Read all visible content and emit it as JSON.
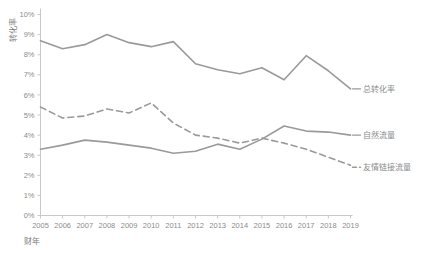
{
  "chart_data": {
    "type": "line",
    "title": "",
    "xlabel": "财年",
    "ylabel": "转化率",
    "x": [
      2005,
      2006,
      2007,
      2008,
      2009,
      2010,
      2011,
      2012,
      2013,
      2014,
      2015,
      2016,
      2017,
      2018,
      2019
    ],
    "xtick_labels": [
      "2005",
      "2006",
      "2007",
      "2008",
      "2009",
      "2010",
      "2011",
      "2012",
      "2013",
      "2014",
      "2015",
      "2016",
      "2017",
      "2018",
      "2019"
    ],
    "ytick_labels": [
      "0%",
      "1%",
      "2%",
      "3%",
      "4%",
      "5%",
      "6%",
      "7%",
      "8%",
      "9%",
      "10%"
    ],
    "ytick_values": [
      0,
      1,
      2,
      3,
      4,
      5,
      6,
      7,
      8,
      9,
      10
    ],
    "ylim": [
      0,
      10
    ],
    "xlim": [
      2005,
      2019
    ],
    "grid": false,
    "legend_position": "right-inline",
    "series": [
      {
        "name": "总转化率",
        "style": "solid",
        "color": "#9a9a9a",
        "values": [
          8.7,
          8.3,
          8.5,
          9.0,
          8.6,
          8.4,
          8.65,
          7.55,
          7.25,
          7.05,
          7.35,
          6.75,
          7.95,
          7.2,
          6.3
        ]
      },
      {
        "name": "自然流量",
        "style": "solid",
        "color": "#9a9a9a",
        "values": [
          3.3,
          3.5,
          3.75,
          3.65,
          3.5,
          3.35,
          3.1,
          3.2,
          3.55,
          3.3,
          3.8,
          4.45,
          4.2,
          4.15,
          4.0
        ]
      },
      {
        "name": "友情链接流量",
        "style": "dashed",
        "color": "#9a9a9a",
        "values": [
          5.4,
          4.85,
          4.95,
          5.3,
          5.1,
          5.6,
          4.6,
          4.0,
          3.85,
          3.6,
          3.85,
          3.6,
          3.3,
          2.9,
          2.5
        ]
      }
    ]
  },
  "axes": {
    "y_axis_title": "转化率",
    "x_axis_title": "财年"
  },
  "legend": {
    "items": [
      {
        "label": "总转化率"
      },
      {
        "label": "自然流量"
      },
      {
        "label": "友情链接流量"
      }
    ]
  },
  "colors": {
    "line": "#9a9a9a",
    "axis": "#c9c9c9",
    "text": "#8c8c8c",
    "background": "#ffffff"
  }
}
